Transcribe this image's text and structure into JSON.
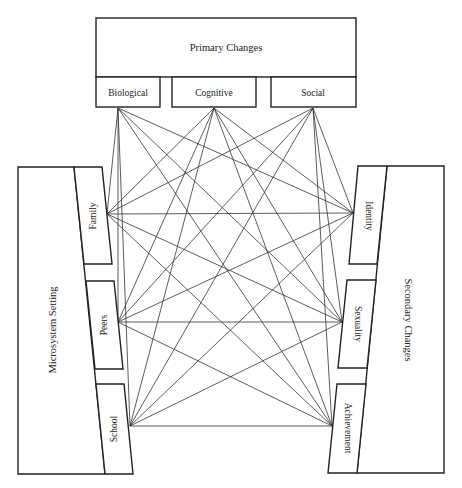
{
  "diagram": {
    "type": "connection-diagram",
    "top": {
      "title": "Primary Changes",
      "nodes": [
        {
          "id": "biological",
          "label": "Biological"
        },
        {
          "id": "cognitive",
          "label": "Cognitive"
        },
        {
          "id": "social",
          "label": "Social"
        }
      ]
    },
    "left": {
      "title": "Microsystem Setting",
      "nodes": [
        {
          "id": "family",
          "label": "Family"
        },
        {
          "id": "peers",
          "label": "Peers"
        },
        {
          "id": "school",
          "label": "School"
        }
      ]
    },
    "right": {
      "title": "Secondary Changes",
      "nodes": [
        {
          "id": "identity",
          "label": "Identity"
        },
        {
          "id": "sexuality",
          "label": "Sexuality"
        },
        {
          "id": "achievement",
          "label": "Achievement"
        }
      ]
    },
    "edges_description": "Every Primary Change connects to every Microsystem Setting and every Secondary Change; every Microsystem Setting connects to every Secondary Change.",
    "colors": {
      "stroke": "#222222",
      "background": "#ffffff"
    }
  }
}
